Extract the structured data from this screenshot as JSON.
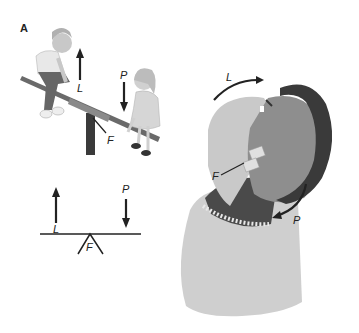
{
  "figure": {
    "panel_label": "A",
    "seesaw": {
      "labels": {
        "load": "L",
        "power": "P",
        "fulcrum": "F"
      }
    },
    "lever_schematic": {
      "labels": {
        "load": "L",
        "power": "P",
        "fulcrum": "F"
      }
    },
    "head_neck": {
      "labels": {
        "load": "L",
        "power": "P",
        "fulcrum": "F"
      }
    },
    "colors": {
      "skin": "#c9c9c9",
      "hair": "#3a3a3a",
      "sweater": "#cfcfcf",
      "collar_dark": "#4a4a4a",
      "line": "#222222"
    }
  }
}
